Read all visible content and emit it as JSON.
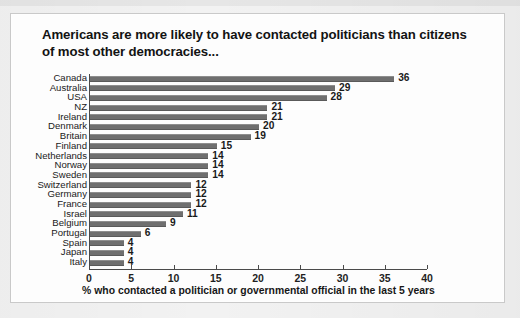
{
  "figure": {
    "title": "Americans are more likely to have contacted politicians than citizens of most other democracies..."
  },
  "chart_data": {
    "type": "bar",
    "orientation": "horizontal",
    "title": "Americans are more likely to have contacted politicians than citizens of most other democracies...",
    "xlabel": "% who contacted a politician or governmental official in the last 5 years",
    "ylabel": "",
    "xlim": [
      0,
      40
    ],
    "xticks": [
      0,
      5,
      10,
      15,
      20,
      25,
      30,
      35,
      40
    ],
    "grid": false,
    "legend": false,
    "bar_color": "#6f6f6f",
    "show_value_labels": true,
    "categories": [
      "Canada",
      "Australia",
      "USA",
      "NZ",
      "Ireland",
      "Denmark",
      "Britain",
      "Finland",
      "Netherlands",
      "Norway",
      "Sweden",
      "Switzerland",
      "Germany",
      "France",
      "Israel",
      "Belgium",
      "Portugal",
      "Spain",
      "Japan",
      "Italy"
    ],
    "values": [
      36,
      29,
      28,
      21,
      21,
      20,
      19,
      15,
      14,
      14,
      14,
      12,
      12,
      12,
      11,
      9,
      6,
      4,
      4,
      4
    ]
  }
}
